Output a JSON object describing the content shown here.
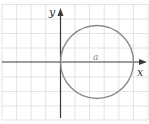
{
  "figure": {
    "axes": {
      "x_label": "x",
      "y_label": "y"
    },
    "curve": {
      "type": "circle",
      "label": "a",
      "color": "#8a8a8a"
    },
    "grid": {
      "visible": true,
      "color": "#dcdcdc"
    }
  }
}
